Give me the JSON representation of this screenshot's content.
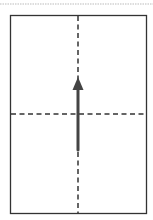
{
  "diagram": {
    "type": "paper-fold-instruction",
    "colors": {
      "outline": "#333333",
      "fold_line": "#333333",
      "arrow": "#444444",
      "top_border": "#bbbbbb",
      "background": "#ffffff"
    },
    "sheet": {
      "x": 10,
      "y": 15,
      "width": 136,
      "height": 198
    },
    "fold_lines": [
      {
        "orientation": "vertical",
        "x": 78,
        "y1": 15,
        "y2": 213
      },
      {
        "orientation": "horizontal",
        "y": 114,
        "x1": 10,
        "x2": 146
      }
    ],
    "arrow": {
      "direction": "up",
      "x": 78,
      "y_start": 150,
      "y_end": 77
    }
  }
}
